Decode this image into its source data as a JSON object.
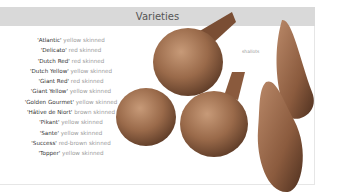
{
  "section": {
    "title": "Varieties"
  },
  "varieties": [
    {
      "name": "'Atlantic'",
      "desc": " yellow skinned"
    },
    {
      "name": "'Delicato'",
      "desc": " red skinned"
    },
    {
      "name": "'Dutch Red'",
      "desc": " red skinned"
    },
    {
      "name": "'Dutch Yellow'",
      "desc": " yellow skinned"
    },
    {
      "name": "'Giant Red'",
      "desc": " red skinned"
    },
    {
      "name": "'Giant Yellow'",
      "desc": " yellow skinned"
    },
    {
      "name": "'Golden Gourmet'",
      "desc": " yellow skinned"
    },
    {
      "name": "'Hâtive de Niort'",
      "desc": " brown skinned"
    },
    {
      "name": "'Pikant'",
      "desc": " yellow skinned"
    },
    {
      "name": "'Sante'",
      "desc": " yellow skinned"
    },
    {
      "name": "'Success'",
      "desc": " red-brown skinned"
    },
    {
      "name": "'Topper'",
      "desc": " yellow skinned"
    }
  ],
  "image": {
    "caption": "shallots"
  },
  "colors": {
    "header_bg": "#d9d9d9",
    "onion_skin": "#9a6a4a"
  }
}
